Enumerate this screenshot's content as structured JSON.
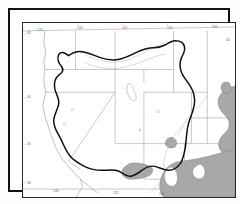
{
  "figure": {
    "kind": "distribution-range-map",
    "region": "Western United States and northern Mexico",
    "background_color": "#ffffff",
    "frame": {
      "outer_border_color": "#111111",
      "inner_border_color": "#2a2a2a"
    }
  },
  "map": {
    "graticule_label_color": "#6b6b6b",
    "state_boundary_color": "#9a9a9a",
    "coastline_color": "#8f8f8f",
    "range_outline_color": "#101010",
    "shaded_fill_color": "#a8a8a8",
    "shaded_stroke_color": "#7d7d7d",
    "enclave_fill_color": "#ffffff",
    "lake_stroke_color": "#9a9a9a"
  },
  "graticule": {
    "top_labels": [
      {
        "text": "125",
        "x": 22,
        "y": 17
      },
      {
        "text": "120",
        "x": 62,
        "y": 15
      },
      {
        "text": "115",
        "x": 108,
        "y": 15
      },
      {
        "text": "110",
        "x": 152,
        "y": 15
      },
      {
        "text": "105",
        "x": 198,
        "y": 15
      }
    ],
    "left_labels": [
      {
        "text": "45",
        "x": 15,
        "y": 21
      },
      {
        "text": "40",
        "x": 15,
        "y": 85
      },
      {
        "text": "35",
        "x": 15,
        "y": 132
      },
      {
        "text": "30",
        "x": 15,
        "y": 171
      }
    ],
    "bottom_labels": [
      {
        "text": "120",
        "x": 40,
        "y": 180
      },
      {
        "text": "115",
        "x": 100,
        "y": 182
      },
      {
        "text": "110",
        "x": 146,
        "y": 183
      }
    ],
    "right_labels": [
      {
        "text": "45",
        "x": 214,
        "y": 28
      }
    ]
  },
  "state_labels": [
    {
      "text": "O",
      "x": 56,
      "y": 96
    },
    {
      "text": "D",
      "x": 142,
      "y": 98
    },
    {
      "text": "P",
      "x": 124,
      "y": 117
    },
    {
      "text": "C",
      "x": 48,
      "y": 110
    }
  ]
}
